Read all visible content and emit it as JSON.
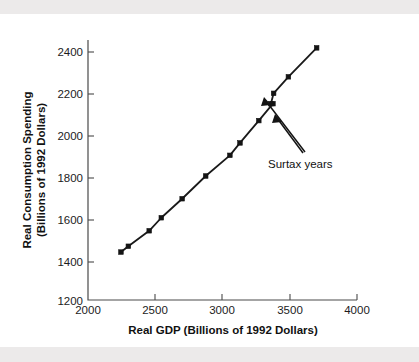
{
  "figure": {
    "background_color": "#ffffff",
    "band_color": "#eceaea",
    "line_color": "#141414"
  },
  "chart_data": {
    "type": "line",
    "title": "",
    "xlabel": "Real GDP (Billions of 1992 Dollars)",
    "ylabel": "Real Consumption Spending (Billions of 1992 Dollars)",
    "ylabel_line1": "Real Consumption Spending",
    "ylabel_line2": "(Billions of 1992 Dollars)",
    "xlim": [
      2000,
      4000
    ],
    "ylim": [
      1200,
      2400
    ],
    "xticks": [
      2000,
      2500,
      3000,
      3500,
      4000
    ],
    "yticks": [
      1200,
      1400,
      1600,
      1800,
      2000,
      2200,
      2400
    ],
    "xtick_labels": [
      "2000",
      "2500",
      "3000",
      "3500",
      "4000"
    ],
    "ytick_labels": [
      "1200",
      "1400",
      "1600",
      "1800",
      "2000",
      "2200",
      "2400"
    ],
    "grid": false,
    "legend": false,
    "marker": "square",
    "series": [
      {
        "name": "Consumption function",
        "x": [
          2245,
          2300,
          2455,
          2545,
          2700,
          2875,
          3055,
          3130,
          3270,
          3375,
          3360,
          3380,
          3490,
          3700
        ],
        "y": [
          1432,
          1460,
          1535,
          1598,
          1690,
          1800,
          1900,
          1960,
          2068,
          2150,
          2150,
          2200,
          2280,
          2420
        ]
      }
    ],
    "annotations": [
      {
        "text": "Surtax years",
        "x": 3345,
        "y": 1888,
        "points_to": [
          {
            "x": 3270,
            "y": 2068
          },
          {
            "x": 3375,
            "y": 2150
          }
        ]
      }
    ]
  }
}
